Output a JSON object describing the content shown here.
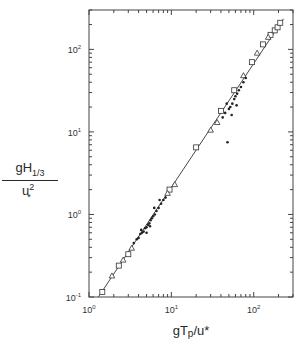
{
  "chart_data": {
    "type": "scatter",
    "title": "",
    "xlabel": "gTp/u*",
    "ylabel": "gH1/3 / u*^2",
    "xscale": "log",
    "yscale": "log",
    "xlim": [
      1,
      300
    ],
    "ylim": [
      0.1,
      300
    ],
    "grid": false,
    "legend": null,
    "x_tick_labels": [
      "10^0",
      "10^1",
      "10^2"
    ],
    "y_tick_labels": [
      "10^-1",
      "10^0",
      "10^1",
      "10^2"
    ],
    "fit_line": {
      "x": [
        1.3,
        230
      ],
      "y": [
        0.1,
        235
      ]
    },
    "series": [
      {
        "name": "open squares",
        "marker": "square-open",
        "x": [
          1.45,
          2.3,
          3.0,
          9.5,
          20,
          40,
          58,
          95,
          130,
          160,
          180,
          195,
          210
        ],
        "y": [
          0.115,
          0.24,
          0.33,
          2.0,
          6.5,
          18,
          32,
          70,
          115,
          150,
          170,
          185,
          210
        ]
      },
      {
        "name": "open triangles",
        "marker": "triangle-open",
        "x": [
          1.9,
          2.6,
          3.3,
          9.0,
          11,
          30,
          36,
          75,
          110,
          150
        ],
        "y": [
          0.18,
          0.28,
          0.39,
          1.8,
          2.3,
          10.5,
          13,
          48,
          90,
          140
        ]
      },
      {
        "name": "filled dots",
        "marker": "dot-filled",
        "x": [
          3.5,
          3.8,
          4.0,
          4.2,
          4.4,
          4.6,
          4.8,
          5.0,
          5.2,
          5.4,
          5.6,
          5.8,
          6.0,
          6.3,
          6.6,
          7.0,
          7.5,
          8.0,
          8.5,
          5.0,
          6.2,
          7.2,
          4.3,
          5.5,
          48,
          42,
          45,
          50,
          52,
          55,
          58,
          60,
          63,
          66,
          70,
          75,
          80,
          54,
          62,
          47
        ],
        "y": [
          0.45,
          0.5,
          0.52,
          0.58,
          0.6,
          0.62,
          0.68,
          0.7,
          0.75,
          0.78,
          0.85,
          0.9,
          0.95,
          1.0,
          1.1,
          1.2,
          1.35,
          1.5,
          1.6,
          0.6,
          1.2,
          1.5,
          0.65,
          0.72,
          7.5,
          15,
          17,
          19,
          20,
          22,
          25,
          27,
          29,
          32,
          35,
          40,
          45,
          16,
          21,
          22
        ]
      }
    ]
  },
  "axes": {
    "x_title_base": "gT",
    "x_title_sub": "p",
    "x_title_rest": "/u*",
    "y_title_num_base": "gH",
    "y_title_num_sub": "1/3",
    "y_title_den_base": "u",
    "y_title_den_sub": "*",
    "y_title_den_sup": "2"
  }
}
